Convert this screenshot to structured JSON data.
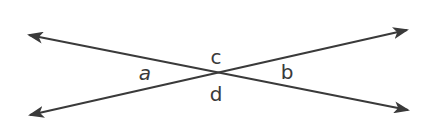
{
  "diagram": {
    "type": "intersecting-lines",
    "colors": {
      "line": "#3a3a3a",
      "label": "#3a3a3a",
      "background": "#ffffff"
    },
    "intersection": {
      "x": 214,
      "y": 73
    },
    "lines": [
      {
        "name": "line-1",
        "from": {
          "x": 29,
          "y": 35
        },
        "to": {
          "x": 408,
          "y": 110
        },
        "arrowheads": "both"
      },
      {
        "name": "line-2",
        "from": {
          "x": 30,
          "y": 115
        },
        "to": {
          "x": 407,
          "y": 30
        },
        "arrowheads": "both"
      }
    ],
    "labels": [
      {
        "id": "a",
        "text": "a",
        "x": 145,
        "y": 80
      },
      {
        "id": "c",
        "text": "c",
        "x": 216,
        "y": 64
      },
      {
        "id": "b",
        "text": "b",
        "x": 287,
        "y": 79
      },
      {
        "id": "d",
        "text": "d",
        "x": 216,
        "y": 101
      }
    ]
  }
}
